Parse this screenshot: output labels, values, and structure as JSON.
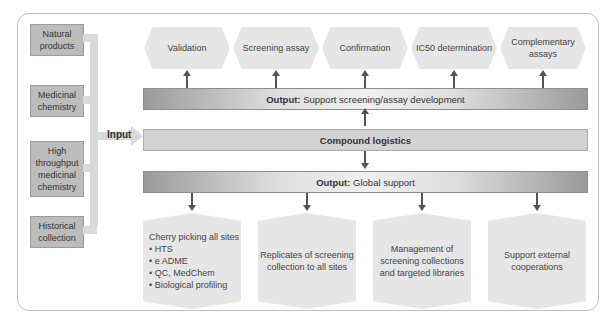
{
  "inputs": [
    {
      "label": "Natural products"
    },
    {
      "label": "Medicinal chemistry"
    },
    {
      "label": "High throughput medicinal chemistry"
    },
    {
      "label": "Historical collection"
    }
  ],
  "input_label": "Input",
  "top_output": {
    "prefix": "Output:",
    "text": "Support screening/assay development"
  },
  "center": {
    "label": "Compound logistics"
  },
  "bottom_output": {
    "prefix": "Output:",
    "text": "Global support"
  },
  "top_boxes": [
    {
      "label": "Validation"
    },
    {
      "label": "Screening assay"
    },
    {
      "label": "Confirmation"
    },
    {
      "label": "IC50 determination"
    },
    {
      "label": "Complementary assays"
    }
  ],
  "bottom_boxes": [
    {
      "title": "Cherry picking all sites",
      "bullets": [
        "HTS",
        "e ADME",
        "QC, MedChem",
        "Biological profiling"
      ]
    },
    {
      "label": "Replicates of screening collection to all sites"
    },
    {
      "label": "Management of screening collections and targeted libraries"
    },
    {
      "label": "Support external cooperations"
    }
  ],
  "colors": {
    "box_fill": "#bcbcbc",
    "hex_fill": "#e6e6e6",
    "arrow": "#555555",
    "connector": "#d9d9d9"
  }
}
